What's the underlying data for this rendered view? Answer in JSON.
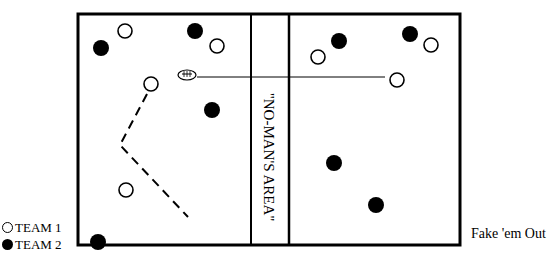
{
  "diagram": {
    "caption": "Fake 'em Out",
    "no_mans_area_label": "\"NO-MAN'S AREA\"",
    "legend": [
      {
        "symbol": "open-circle",
        "label": "TEAM 1"
      },
      {
        "symbol": "filled-circle",
        "label": "TEAM 2"
      }
    ],
    "colors": {
      "ink": "#000000",
      "background": "#ffffff"
    },
    "field": {
      "x": 77,
      "y": 13,
      "width": 384,
      "height": 233
    },
    "no_mans_area": {
      "x1": 251,
      "x2": 289
    },
    "players": {
      "team1": [
        {
          "x": 125,
          "y": 31
        },
        {
          "x": 217,
          "y": 46
        },
        {
          "x": 151,
          "y": 84
        },
        {
          "x": 126,
          "y": 190
        },
        {
          "x": 318,
          "y": 57
        },
        {
          "x": 431,
          "y": 45
        },
        {
          "x": 397,
          "y": 80
        }
      ],
      "team2": [
        {
          "x": 101,
          "y": 48
        },
        {
          "x": 195,
          "y": 31
        },
        {
          "x": 212,
          "y": 110
        },
        {
          "x": 98,
          "y": 242
        },
        {
          "x": 339,
          "y": 41
        },
        {
          "x": 410,
          "y": 34
        },
        {
          "x": 334,
          "y": 163
        },
        {
          "x": 376,
          "y": 205
        }
      ]
    },
    "ball": {
      "x": 187,
      "y": 75
    },
    "pass_line": {
      "x1": 197,
      "y1": 77,
      "x2": 385,
      "y2": 77
    },
    "run_route": [
      [
        147,
        94
      ],
      [
        120,
        145
      ],
      [
        188,
        217
      ]
    ]
  }
}
